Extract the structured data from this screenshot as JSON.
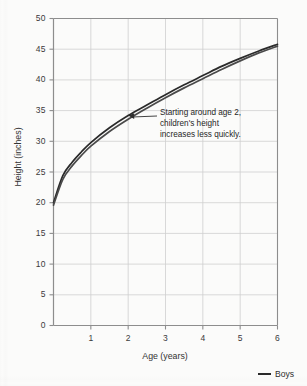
{
  "chart_data": {
    "type": "line",
    "title": "",
    "subtitle": "",
    "xlabel": "Age (years)",
    "ylabel": "Height (inches)",
    "xlim": [
      0,
      6
    ],
    "ylim": [
      0,
      50
    ],
    "xticks": [
      "1",
      "2",
      "3",
      "4",
      "5",
      "6"
    ],
    "xtick_values": [
      1,
      2,
      3,
      4,
      5,
      6
    ],
    "yticks": [
      "0",
      "5",
      "10",
      "15",
      "20",
      "25",
      "30",
      "35",
      "40",
      "45",
      "50"
    ],
    "ytick_values": [
      0,
      5,
      10,
      15,
      20,
      25,
      30,
      35,
      40,
      45,
      50
    ],
    "grid": true,
    "legend_position": "bottom-right",
    "x": [
      0,
      0.25,
      0.5,
      0.75,
      1,
      1.5,
      2,
      2.5,
      3,
      3.5,
      4,
      4.5,
      5,
      5.5,
      6
    ],
    "series": [
      {
        "name": "Boys",
        "color": "#2a2a2a",
        "values": [
          20.0,
          24.4,
          26.6,
          28.3,
          29.8,
          32.2,
          34.2,
          35.9,
          37.6,
          39.2,
          40.7,
          42.2,
          43.5,
          44.7,
          45.8
        ]
      },
      {
        "name": "Girls",
        "color": "#4a4a4a",
        "values": [
          19.6,
          23.8,
          26.0,
          27.7,
          29.2,
          31.6,
          33.6,
          35.4,
          37.1,
          38.7,
          40.2,
          41.7,
          43.1,
          44.4,
          45.5
        ]
      }
    ],
    "annotations": [
      {
        "name": "slowing-growth-note",
        "lines": [
          "Starting around age 2,",
          "children's height",
          "increases less quickly."
        ],
        "target_x": 2.0,
        "target_y": 34.2
      }
    ],
    "legend": [
      {
        "label": "Boys",
        "color": "#2a2a2a"
      }
    ],
    "colors": {
      "axis": "#8d8d8d",
      "grid": "#cfcfcf",
      "curve": "#2a2a2a",
      "text": "#2b2b2b",
      "background": "#fbfbfa"
    }
  }
}
